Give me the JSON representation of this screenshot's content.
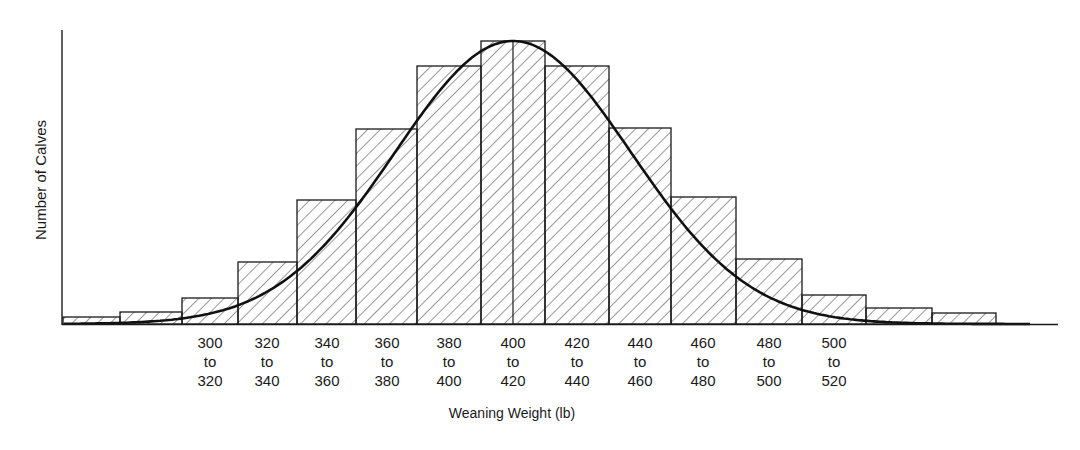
{
  "chart_data": {
    "type": "bar",
    "subtype": "histogram_with_normal_curve",
    "title": "",
    "xlabel": "Weaning Weight (lb)",
    "ylabel": "Number of Calves",
    "categories": [
      "260 to 280",
      "280 to 300",
      "300 to 320",
      "320 to 340",
      "340 to 360",
      "360 to 380",
      "380 to 400",
      "400 to 420",
      "420 to 440",
      "440 to 460",
      "460 to 480",
      "480 to 500",
      "500 to 520",
      "520 to 540",
      "540 to 560"
    ],
    "values": [
      7,
      12,
      26,
      62,
      124,
      195,
      258,
      283,
      258,
      196,
      127,
      65,
      29,
      16,
      11
    ],
    "value_note": "Relative bar heights (no y-axis ticks shown); units are arbitrary",
    "tick_labels": [
      {
        "top": "300",
        "mid": "to",
        "bottom": "320"
      },
      {
        "top": "320",
        "mid": "to",
        "bottom": "340"
      },
      {
        "top": "340",
        "mid": "to",
        "bottom": "360"
      },
      {
        "top": "360",
        "mid": "to",
        "bottom": "380"
      },
      {
        "top": "380",
        "mid": "to",
        "bottom": "400"
      },
      {
        "top": "400",
        "mid": "to",
        "bottom": "420"
      },
      {
        "top": "420",
        "mid": "to",
        "bottom": "440"
      },
      {
        "top": "440",
        "mid": "to",
        "bottom": "460"
      },
      {
        "top": "460",
        "mid": "to",
        "bottom": "480"
      },
      {
        "top": "480",
        "mid": "to",
        "bottom": "500"
      },
      {
        "top": "500",
        "mid": "to",
        "bottom": "520"
      }
    ],
    "overlay": {
      "type": "normal_curve",
      "mean": 410
    },
    "grid": false,
    "legend": null,
    "bar_fill": "diagonal-hatch",
    "line_color": "#1a1a1a"
  },
  "layout": {
    "baseline_y": 324,
    "px_per_unit": 1,
    "bars_px": [
      {
        "x0": 63,
        "x1": 120,
        "top": 317
      },
      {
        "x0": 120,
        "x1": 182,
        "top": 312
      },
      {
        "x0": 182,
        "x1": 238,
        "top": 298
      },
      {
        "x0": 238,
        "x1": 297,
        "top": 262
      },
      {
        "x0": 297,
        "x1": 356,
        "top": 200
      },
      {
        "x0": 356,
        "x1": 417,
        "top": 129
      },
      {
        "x0": 417,
        "x1": 481,
        "top": 66
      },
      {
        "x0": 481,
        "x1": 545,
        "top": 41
      },
      {
        "x0": 545,
        "x1": 609,
        "top": 66
      },
      {
        "x0": 609,
        "x1": 671,
        "top": 128
      },
      {
        "x0": 671,
        "x1": 736,
        "top": 197
      },
      {
        "x0": 736,
        "x1": 802,
        "top": 259
      },
      {
        "x0": 802,
        "x1": 866,
        "top": 295
      },
      {
        "x0": 866,
        "x1": 932,
        "top": 308
      },
      {
        "x0": 932,
        "x1": 996,
        "top": 313
      }
    ],
    "tick_x": [
      210,
      267,
      327,
      387,
      449,
      513,
      577,
      640,
      703,
      769,
      834
    ]
  }
}
